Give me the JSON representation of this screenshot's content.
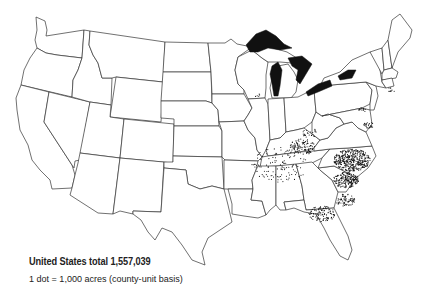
{
  "map": {
    "type": "dot-density",
    "region": "United States (conterminous)",
    "dot_color": "#111111",
    "lake_color": "#111111",
    "outline_color": "#333333",
    "background": "#ffffff"
  },
  "legend": {
    "total_label": "United States total 1,557,039",
    "scale_label": "1 dot = 1,000 acres (county-unit basis)"
  },
  "dot_clusters": [
    {
      "region": "North Carolina / Virginia piedmont",
      "density": "very high",
      "cx": 352,
      "cy": 160,
      "r": 14,
      "count": 420
    },
    {
      "region": "Eastern North Carolina",
      "density": "high",
      "cx": 346,
      "cy": 180,
      "r": 10,
      "count": 200
    },
    {
      "region": "Kentucky (Bluegrass)",
      "density": "medium",
      "cx": 302,
      "cy": 147,
      "r": 10,
      "count": 110
    },
    {
      "region": "Kentucky / Tennessee border belt",
      "density": "low",
      "cx": 280,
      "cy": 165,
      "r": 22,
      "count": 120
    },
    {
      "region": "South Carolina pee dee",
      "density": "medium",
      "cx": 345,
      "cy": 200,
      "r": 8,
      "count": 70
    },
    {
      "region": "South Georgia / North Florida",
      "density": "medium",
      "cx": 322,
      "cy": 214,
      "r": 10,
      "count": 110
    },
    {
      "region": "Southern Maryland",
      "density": "low",
      "cx": 369,
      "cy": 125,
      "r": 4,
      "count": 25
    },
    {
      "region": "Pennsylvania (Lancaster)",
      "density": "low",
      "cx": 362,
      "cy": 110,
      "r": 3,
      "count": 15
    },
    {
      "region": "Connecticut Valley",
      "density": "low",
      "cx": 391,
      "cy": 90,
      "r": 3,
      "count": 10
    },
    {
      "region": "Ohio River (S. Ohio)",
      "density": "low",
      "cx": 310,
      "cy": 133,
      "r": 6,
      "count": 25
    },
    {
      "region": "Wisconsin",
      "density": "very low",
      "cx": 258,
      "cy": 95,
      "r": 3,
      "count": 5
    }
  ]
}
